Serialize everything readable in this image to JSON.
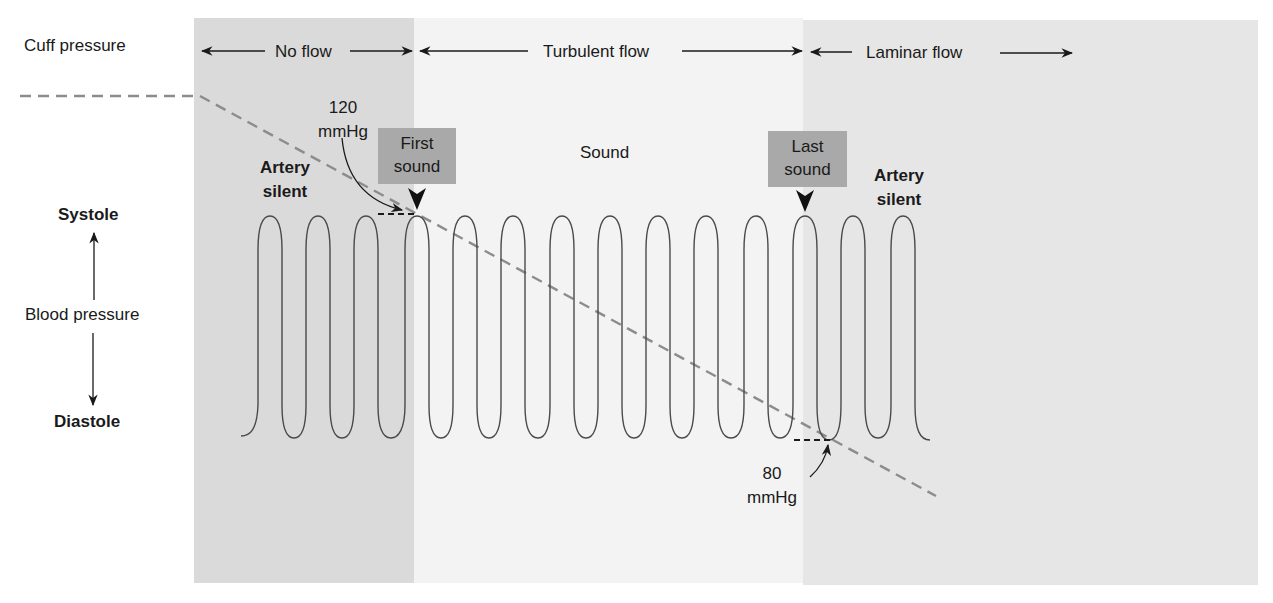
{
  "figure": {
    "regions": [
      {
        "name": "No flow",
        "x_start": 194,
        "x_end": 414,
        "color": "#dadada"
      },
      {
        "name": "Turbulent flow",
        "x_start": 414,
        "x_end": 803,
        "color": "#f3f3f3"
      },
      {
        "name": "Laminar flow",
        "x_start": 803,
        "x_end": 1258,
        "color": "#e6e6e6"
      }
    ],
    "labels": {
      "cuff_pressure": "Cuff pressure",
      "no_flow": "No flow",
      "turbulent_flow": "Turbulent flow",
      "laminar_flow": "Laminar flow",
      "systolic_value": "120",
      "systolic_unit": "mmHg",
      "first_sound_line1": "First",
      "first_sound_line2": "sound",
      "sound": "Sound",
      "last_sound_line1": "Last",
      "last_sound_line2": "sound",
      "artery_silent_left_line1": "Artery",
      "artery_silent_left_line2": "silent",
      "artery_silent_right_line1": "Artery",
      "artery_silent_right_line2": "silent",
      "systole": "Systole",
      "blood_pressure": "Blood pressure",
      "diastole": "Diastole",
      "diastolic_value": "80",
      "diastolic_unit": "mmHg"
    },
    "colors": {
      "box_fill": "#a9a9a9",
      "dashed_line": "#8c8c8c",
      "waveform": "#4a4a4a",
      "text": "#1a1a1a"
    },
    "waveform": {
      "peak_y": 216,
      "trough_y": 438,
      "start_x": 241,
      "end_x": 930,
      "peaks_x": [
        270,
        318,
        366,
        417,
        465,
        513,
        562,
        610,
        658,
        706,
        756,
        805,
        853,
        903
      ],
      "first_sound_peak_x": 417,
      "last_sound_peak_x": 805
    },
    "cuff_line": {
      "flat_start": [
        20,
        96
      ],
      "bend": [
        200,
        96
      ],
      "end": [
        936,
        496
      ]
    },
    "pressures": {
      "systolic_mmHg": 120,
      "diastolic_mmHg": 80
    }
  }
}
